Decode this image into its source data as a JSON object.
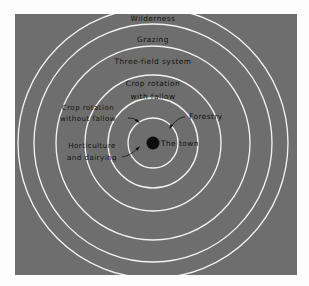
{
  "figure": {
    "background_color": "#6e6e6e",
    "page_color": "#fdfdfd",
    "ring_color": "#f2f2ef",
    "text_color": "#14130f",
    "center_dot_color": "#0d0d0b"
  },
  "panel": {
    "x": 15,
    "y": 14,
    "width": 282,
    "height": 261
  },
  "center": {
    "x": 153,
    "y": 143,
    "dot_radius": 6.5
  },
  "chart_data": {
    "type": "diagram",
    "subtype": "concentric-ring-land-use-model",
    "center_label": "The town",
    "rings": [
      {
        "index": 1,
        "radius": 12,
        "label": "Horticulture and dairying"
      },
      {
        "index": 2,
        "radius": 25,
        "label": "Forestry"
      },
      {
        "index": 3,
        "radius": 45,
        "label": "Crop rotation without fallow"
      },
      {
        "index": 4,
        "radius": 68,
        "label": "Crop rotation with fallow"
      },
      {
        "index": 5,
        "radius": 97,
        "label": "Three-field system"
      },
      {
        "index": 6,
        "radius": 119,
        "label": "Grazing"
      },
      {
        "index": 7,
        "radius": 135,
        "label": "Wilderness"
      }
    ],
    "legend": "none",
    "grid": false,
    "axis": "none"
  },
  "labels": {
    "wilderness": {
      "text": "Wilderness",
      "x": 153,
      "y": 21
    },
    "grazing": {
      "text": "Grazing",
      "x": 153,
      "y": 42
    },
    "three_field_system": {
      "text": "Three-field system",
      "x": 153,
      "y": 64
    },
    "crop_rotation_with_fallow": {
      "line1": "Crop  rotation",
      "line2": "with  fallow",
      "x": 153,
      "y1": 86,
      "y2": 99
    },
    "crop_rotation_without_fallow": {
      "line1": "Crop  rotation",
      "line2": "without  fallow",
      "x": 88,
      "y1": 110,
      "y2": 121
    },
    "forestry": {
      "text": "Forestry",
      "x": 203,
      "y": 119
    },
    "the_town": {
      "text": "The town",
      "x": 165,
      "y": 146
    },
    "horticulture_and_dairying": {
      "line1": "Horticulture",
      "line2": "and  dairying",
      "x": 92,
      "y1": 148,
      "y2": 160
    }
  }
}
